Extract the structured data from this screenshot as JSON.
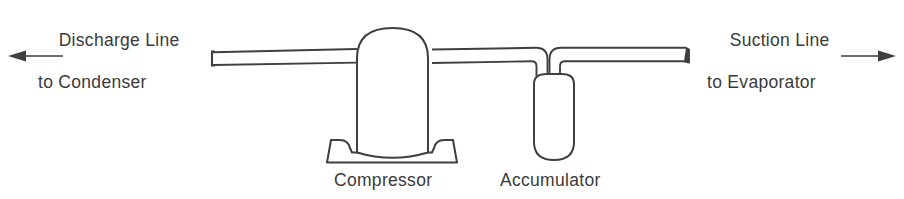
{
  "diagram": {
    "background_color": "#ffffff",
    "line_color": "#3f3f3f",
    "text_color": "#3a3a3a",
    "labels": {
      "discharge_line_1": "Discharge Line",
      "discharge_line_2": "to Condenser",
      "suction_line_1": "Suction Line",
      "suction_line_2": "to Evaporator",
      "compressor": "Compressor",
      "accumulator": "Accumulator"
    },
    "arrows": {
      "left_direction": "left",
      "right_direction": "right"
    },
    "components": [
      {
        "name": "compressor",
        "label": "Compressor",
        "shape": "dome-on-pedestal-base"
      },
      {
        "name": "accumulator",
        "label": "Accumulator",
        "shape": "vertical-capsule"
      },
      {
        "name": "discharge-pipe",
        "label": "Discharge Line to Condenser",
        "shape": "horizontal-double-line-pipe-capped-left"
      },
      {
        "name": "suction-pipe",
        "label": "Suction Line to Evaporator",
        "shape": "horizontal-double-line-pipe-capped-right"
      }
    ]
  }
}
